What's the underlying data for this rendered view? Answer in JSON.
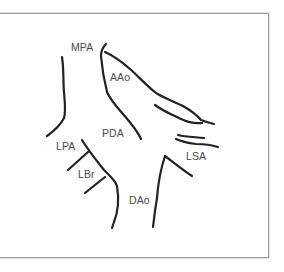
{
  "diagram": {
    "type": "anatomical-line-drawing",
    "labels": [
      {
        "id": "mpa",
        "text": "MPA",
        "x": 71,
        "y": 42
      },
      {
        "id": "aao",
        "text": "AAo",
        "x": 110,
        "y": 72
      },
      {
        "id": "pda",
        "text": "PDA",
        "x": 102,
        "y": 128
      },
      {
        "id": "lpa",
        "text": "LPA",
        "x": 56,
        "y": 141
      },
      {
        "id": "lbr",
        "text": "LBr",
        "x": 78,
        "y": 169
      },
      {
        "id": "lsa",
        "text": "LSA",
        "x": 186,
        "y": 151
      },
      {
        "id": "dao",
        "text": "DAo",
        "x": 129,
        "y": 195
      }
    ],
    "colors": {
      "stroke": "#222222",
      "label": "#4a4a4a",
      "frame": "#9a9a9a",
      "background": "#ffffff"
    }
  }
}
